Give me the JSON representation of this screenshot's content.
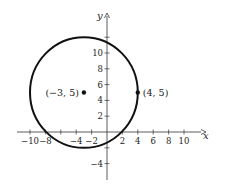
{
  "chart_data": {
    "type": "scatter",
    "title": "",
    "xlabel": "x",
    "ylabel": "y",
    "xlim": [
      -11.5,
      12
    ],
    "ylim": [
      -5,
      15
    ],
    "grid": false,
    "x_ticks": [
      -10,
      -8,
      -4,
      -2,
      2,
      4,
      6,
      8,
      10
    ],
    "x_tick_labels": [
      "−10",
      "−8",
      "−4",
      "−2",
      "2",
      "4",
      "6",
      "8",
      "10"
    ],
    "x_minor_ticks": [
      -6
    ],
    "y_ticks": [
      -4,
      2,
      4,
      6,
      8,
      10
    ],
    "y_tick_labels": [
      "−4",
      "2",
      "4",
      "6",
      "8",
      "10"
    ],
    "y_minor_ticks": [
      -2,
      12
    ],
    "circle": {
      "center": [
        -3,
        5
      ],
      "radius": 7
    },
    "points": [
      {
        "x": -3,
        "y": 5,
        "label": "(−3, 5)",
        "label_side": "left"
      },
      {
        "x": 4,
        "y": 5,
        "label": "(4, 5)",
        "label_side": "right"
      }
    ]
  },
  "axis_labels": {
    "x": "x",
    "y": "y"
  }
}
